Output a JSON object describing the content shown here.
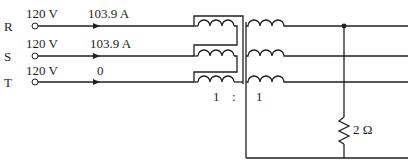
{
  "phases": [
    {
      "name": "R",
      "voltage": "120 V",
      "current": "103.9 A"
    },
    {
      "name": "S",
      "voltage": "120 V",
      "current": "103.9 A"
    },
    {
      "name": "T",
      "voltage": "120 V",
      "current": "0"
    }
  ],
  "transformer": {
    "ratio_primary": "1",
    "ratio_separator": ":",
    "ratio_secondary": "1"
  },
  "load": {
    "resistance": "2 Ω"
  },
  "colors": {
    "line": "#231f20",
    "background": "#ffffff"
  }
}
